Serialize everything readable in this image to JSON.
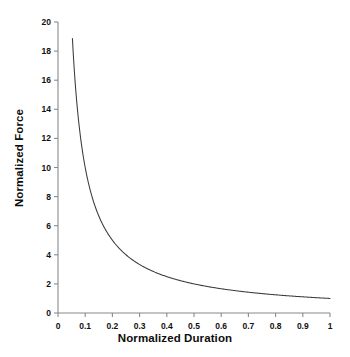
{
  "chart_data": {
    "type": "line",
    "title": "",
    "xlabel": "Normalized Duration",
    "ylabel": "Normalized Force",
    "xlim": [
      0,
      1
    ],
    "ylim": [
      0,
      20
    ],
    "grid": false,
    "legend": null,
    "xticks": [
      "0",
      "0.1",
      "0.2",
      "0.3",
      "0.4",
      "0.5",
      "0.6",
      "0.7",
      "0.8",
      "0.9",
      "1"
    ],
    "xtick_values": [
      0,
      0.1,
      0.2,
      0.3,
      0.4,
      0.5,
      0.6,
      0.7,
      0.8,
      0.9,
      1
    ],
    "yticks": [
      "0",
      "2",
      "4",
      "6",
      "8",
      "10",
      "12",
      "14",
      "16",
      "18",
      "20"
    ],
    "ytick_values": [
      0,
      2,
      4,
      6,
      8,
      10,
      12,
      14,
      16,
      18,
      20
    ],
    "line_color": "#3a3a3a",
    "line_width": 1,
    "series": [
      {
        "name": "Normalized Force vs Normalized Duration",
        "relation": "y = 1 / x",
        "x": [
          0.053,
          0.06,
          0.07,
          0.08,
          0.09,
          0.1,
          0.12,
          0.14,
          0.16,
          0.18,
          0.2,
          0.25,
          0.3,
          0.35,
          0.4,
          0.45,
          0.5,
          0.55,
          0.6,
          0.65,
          0.7,
          0.75,
          0.8,
          0.85,
          0.9,
          0.95,
          1.0
        ],
        "y": [
          18.9,
          16.67,
          14.29,
          12.5,
          11.11,
          10.0,
          8.33,
          7.14,
          6.25,
          5.56,
          5.0,
          4.0,
          3.33,
          2.86,
          2.5,
          2.22,
          2.0,
          1.82,
          1.67,
          1.54,
          1.43,
          1.33,
          1.25,
          1.18,
          1.11,
          1.05,
          1.0
        ]
      }
    ]
  },
  "axes": {
    "x_label": "Normalized Duration",
    "y_label": "Normalized Force"
  }
}
